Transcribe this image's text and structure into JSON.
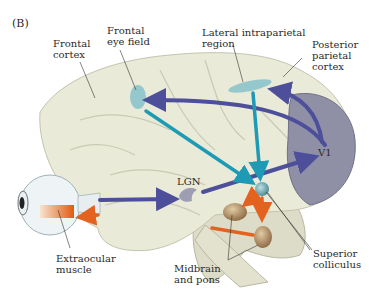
{
  "panel_label": "(B)",
  "labels": {
    "frontal_cortex": "Frontal\ncortex",
    "frontal_eye_field": "Frontal\neye field",
    "lateral_intraparietal": "Lateral intraparietal\nregion",
    "posterior_parietal": "Posterior\nparietal\ncortex",
    "v1": "V1",
    "lgn": "LGN",
    "extraocular_muscle": "Extraocular\nmuscle",
    "midbrain_pons": "Midbrain\nand pons",
    "superior_colliculus": "Superior\ncolliculus"
  },
  "colors": {
    "brain": "#e9ead8",
    "brain_shadow": "#cfd1bc",
    "occipital": "#8f90a6",
    "visual_pathway_arrow": "#4d4f9a",
    "cortical_output_arrow": "#1e9ab5",
    "motor_arrow": "#e4621f",
    "region_highlight": "#8cc4cc",
    "brainstem_nuclei": "#b9956a"
  }
}
